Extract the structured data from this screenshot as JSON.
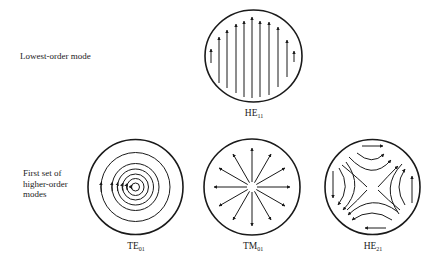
{
  "rows": [
    {
      "label_lines": [
        "Lowest-order mode"
      ]
    },
    {
      "label_lines": [
        "First set of",
        "higher-order",
        "modes"
      ]
    }
  ],
  "modes": [
    {
      "id": "HE11",
      "base": "HE",
      "sub": "11",
      "row": 0,
      "pattern": "parallel-vertical-arrows",
      "arrow_direction": "up",
      "arrow_count": 11
    },
    {
      "id": "TE01",
      "base": "TE",
      "sub": "01",
      "row": 1,
      "pattern": "concentric-circles",
      "ring_count": 6,
      "arrow_direction": "counterclockwise"
    },
    {
      "id": "TM01",
      "base": "TM",
      "sub": "01",
      "row": 1,
      "pattern": "radial-outward-arrows",
      "arrow_count": 12
    },
    {
      "id": "HE21",
      "base": "HE",
      "sub": "21",
      "row": 1,
      "pattern": "hyperbolic-field-lines",
      "arrow_direction": "lower-left-to-upper-right"
    }
  ],
  "colors": {
    "line": "#1a1a1a",
    "background": "#ffffff"
  }
}
